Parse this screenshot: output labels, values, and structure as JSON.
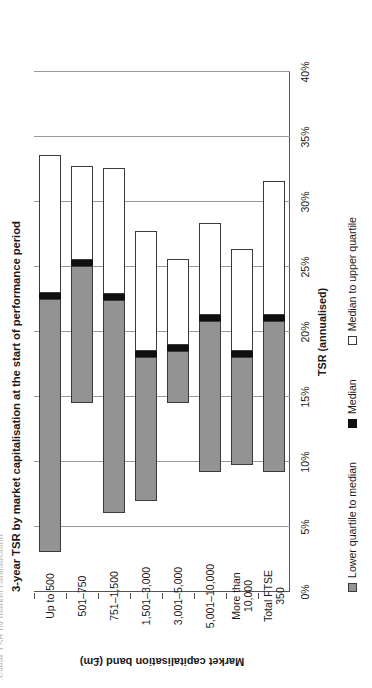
{
  "page": {
    "cropped_header_text": "3-year TSR by market capitalisation"
  },
  "chart_data": {
    "type": "bar",
    "title": "3-year TSR by market capitalisation at the start of performance period",
    "orientation": "vertical-bars-rendered-rotated",
    "xlabel": "Market capitalisation band (£m)",
    "ylabel": "TSR (annualised)",
    "ylim": [
      0,
      40
    ],
    "ytick_labels": [
      "0%",
      "5%",
      "10%",
      "15%",
      "20%",
      "25%",
      "30%",
      "35%",
      "40%"
    ],
    "ytick_values": [
      0,
      5,
      10,
      15,
      20,
      25,
      30,
      35,
      40
    ],
    "grid": true,
    "legend_position": "bottom",
    "legend": [
      {
        "label": "Lower quartile to median",
        "color": "#939393",
        "swatch": "sw-lower"
      },
      {
        "label": "Median",
        "color": "#101010",
        "swatch": "sw-median"
      },
      {
        "label": "Median to upper quartile",
        "color": "#ffffff",
        "swatch": "sw-upper"
      }
    ],
    "categories": [
      "Up to 500",
      "501–750",
      "751–1,500",
      "1,501–3,000",
      "3,001–5,000",
      "5,001–10,000",
      "More than\n10,000",
      "Total FTSE\n350"
    ],
    "series": [
      {
        "name": "Lower quartile",
        "values": [
          3.1,
          14.5,
          6.1,
          7.0,
          14.5,
          9.2,
          9.8,
          9.2
        ]
      },
      {
        "name": "Median",
        "values": [
          22.8,
          25.3,
          22.7,
          18.3,
          18.8,
          21.1,
          18.3,
          21.1
        ]
      },
      {
        "name": "Upper quartile",
        "values": [
          33.6,
          32.8,
          32.6,
          27.8,
          25.6,
          28.4,
          26.4,
          31.6
        ]
      }
    ]
  }
}
